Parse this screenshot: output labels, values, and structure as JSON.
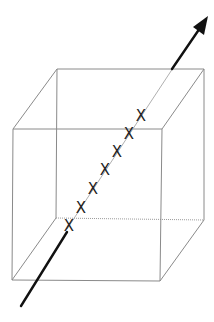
{
  "diagram": {
    "cube": {
      "back_face": {
        "tl": [
          57,
          69
        ],
        "tr": [
          204,
          69
        ],
        "br": [
          204,
          220
        ],
        "bl": [
          56,
          218
        ]
      },
      "front_face": {
        "tl": [
          13,
          129
        ],
        "tr": [
          162,
          129
        ],
        "br": [
          160,
          281
        ],
        "bl": [
          12,
          280
        ]
      },
      "edge_color": "#8a8a8a"
    },
    "arrow": {
      "start": [
        21,
        306
      ],
      "end": [
        207,
        18
      ],
      "color": "#111111"
    },
    "marks": {
      "symbol": "X",
      "count": 7,
      "positions": [
        [
          69,
          226
        ],
        [
          81,
          208
        ],
        [
          93,
          189
        ],
        [
          105,
          170
        ],
        [
          117,
          152
        ],
        [
          129,
          134
        ],
        [
          141,
          116
        ]
      ]
    }
  }
}
